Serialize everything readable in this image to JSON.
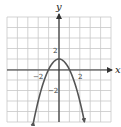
{
  "chart_data": {
    "type": "line",
    "title": "",
    "function": "y = 1 - x^2",
    "xlabel": "x",
    "ylabel": "y",
    "xlim": [
      -5,
      5
    ],
    "ylim": [
      -5,
      5
    ],
    "grid": true,
    "grid_step": 1,
    "tick_labels": {
      "x": [
        {
          "value": -2,
          "label": "−2"
        },
        {
          "value": 2,
          "label": "2"
        }
      ],
      "y": [
        {
          "value": 2,
          "label": "2"
        },
        {
          "value": -2,
          "label": "−2"
        }
      ]
    },
    "series": [
      {
        "name": "parabola",
        "x": [
          -2.45,
          -2,
          -1.5,
          -1,
          -0.5,
          0,
          0.5,
          1,
          1.5,
          2,
          2.45
        ],
        "y": [
          -5,
          -3,
          -1.25,
          0,
          0.75,
          1,
          0.75,
          0,
          -1.25,
          -3,
          -5
        ]
      }
    ],
    "vertex": [
      0,
      1
    ],
    "x_intercepts": [
      -1,
      1
    ],
    "arrows_on_curve_ends": true
  },
  "labels": {
    "x_axis": "x",
    "y_axis": "y",
    "tick_x_neg2": "−2",
    "tick_x_pos2": "2",
    "tick_y_pos2": "2",
    "tick_y_neg2": "−2"
  },
  "colors": {
    "grid": "#c8c8c8",
    "axis": "#333333",
    "curve": "#555555"
  }
}
